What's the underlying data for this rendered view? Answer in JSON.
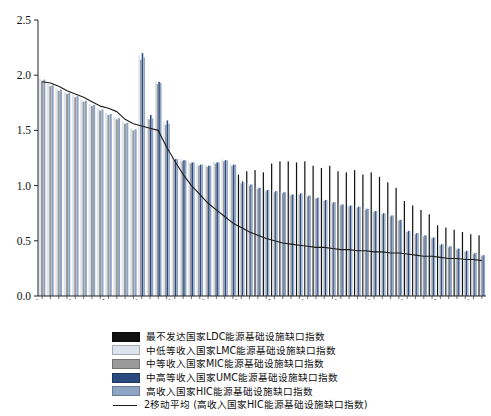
{
  "chart_data": {
    "type": "bar",
    "title": "",
    "xlabel": "",
    "ylabel": "",
    "ylim": [
      0.0,
      2.5
    ],
    "ytick_labels": [
      "0.0",
      "0.5",
      "1.0",
      "1.5",
      "2.0",
      "2.5"
    ],
    "ytick_values": [
      0.0,
      0.5,
      1.0,
      1.5,
      2.0,
      2.5
    ],
    "grid": false,
    "legend_position": "below-plot",
    "xtick_labels": [
      "1960",
      "1964",
      "1968",
      "1972",
      "1976",
      "1980",
      "1984",
      "1988",
      "1992",
      "1996",
      "2000",
      "2004",
      "2008",
      "2012"
    ],
    "categories": [
      1960,
      1961,
      1962,
      1963,
      1964,
      1965,
      1966,
      1967,
      1968,
      1969,
      1970,
      1971,
      1972,
      1973,
      1974,
      1975,
      1976,
      1977,
      1978,
      1979,
      1980,
      1981,
      1982,
      1983,
      1984,
      1985,
      1986,
      1987,
      1988,
      1989,
      1990,
      1991,
      1992,
      1993,
      1994,
      1995,
      1996,
      1997,
      1998,
      1999,
      2000,
      2001,
      2002,
      2003,
      2004,
      2005,
      2006,
      2007,
      2008,
      2009,
      2010,
      2011,
      2012,
      2013
    ],
    "series": [
      {
        "name": "最不发达国家LDC能源基础设施缺口指数",
        "key": "LDC",
        "color": "#111111",
        "values": [
          0,
          0,
          0,
          0,
          0,
          0,
          0,
          0,
          0,
          0,
          0,
          0,
          0,
          0,
          0,
          0,
          0,
          0,
          0,
          0,
          0,
          0,
          0,
          0,
          1.1,
          1.13,
          1.14,
          1.12,
          1.2,
          1.22,
          1.22,
          1.21,
          1.22,
          1.18,
          1.16,
          1.18,
          1.13,
          1.12,
          1.14,
          1.1,
          1.12,
          1.08,
          1.03,
          0.98,
          0.86,
          0.82,
          0.78,
          0.74,
          0.64,
          0.62,
          0.6,
          0.58,
          0.56,
          0.55
        ]
      },
      {
        "name": "中低等收入国家LMC能源基础设施缺口指数",
        "key": "LMC",
        "color": "#dde4ee",
        "values": [
          1.97,
          1.92,
          1.88,
          1.85,
          1.82,
          1.78,
          1.74,
          1.7,
          1.66,
          1.62,
          1.58,
          1.52,
          2.18,
          1.62,
          1.95,
          1.58,
          1.25,
          1.24,
          1.22,
          1.2,
          1.19,
          1.22,
          1.24,
          1.2,
          1.05,
          1.02,
          0.99,
          0.97,
          0.96,
          0.95,
          0.93,
          0.94,
          0.92,
          0.9,
          0.88,
          0.86,
          0.84,
          0.83,
          0.82,
          0.8,
          0.78,
          0.76,
          0.74,
          0.7,
          0.6,
          0.58,
          0.56,
          0.54,
          0.48,
          0.46,
          0.44,
          0.42,
          0.4,
          0.38
        ]
      },
      {
        "name": "中等收入国家MIC能源基础设施缺口指数",
        "key": "MIC",
        "color": "#9a9a9a",
        "values": [
          1.95,
          1.9,
          1.86,
          1.83,
          1.8,
          1.76,
          1.72,
          1.68,
          1.64,
          1.6,
          1.56,
          1.5,
          2.14,
          1.6,
          1.92,
          1.55,
          1.23,
          1.22,
          1.2,
          1.18,
          1.17,
          1.2,
          1.22,
          1.18,
          1.02,
          1.0,
          0.97,
          0.95,
          0.94,
          0.93,
          0.91,
          0.92,
          0.9,
          0.88,
          0.86,
          0.84,
          0.82,
          0.81,
          0.8,
          0.78,
          0.76,
          0.74,
          0.72,
          0.68,
          0.58,
          0.56,
          0.54,
          0.52,
          0.46,
          0.44,
          0.42,
          0.4,
          0.38,
          0.36
        ]
      },
      {
        "name": "中高等收入国家UMC能源基础设施缺口指数",
        "key": "UMC",
        "color": "#2a4a80",
        "values": [
          0,
          0,
          0,
          0,
          0,
          0,
          0,
          0,
          0,
          0,
          0,
          0,
          2.2,
          1.64,
          1.94,
          1.59,
          1.24,
          1.23,
          1.21,
          1.19,
          1.18,
          1.21,
          1.23,
          1.19,
          1.04,
          1.01,
          0.98,
          0.96,
          0.95,
          0.94,
          0.92,
          0.93,
          0.91,
          0.89,
          0.87,
          0.85,
          0.83,
          0.82,
          0.81,
          0.79,
          0.77,
          0.75,
          0.73,
          0.69,
          0.59,
          0.57,
          0.55,
          0.53,
          0.47,
          0.45,
          0.43,
          0.41,
          0.39,
          0.37
        ]
      },
      {
        "name": "高收入国家HIC能源基础设施缺口指数",
        "key": "HIC",
        "color": "#8fa4c4",
        "values": [
          1.96,
          1.91,
          1.87,
          1.84,
          1.81,
          1.77,
          1.73,
          1.69,
          1.65,
          1.61,
          1.57,
          1.51,
          2.16,
          1.61,
          1.93,
          1.56,
          1.24,
          1.23,
          1.21,
          1.19,
          1.18,
          1.21,
          1.23,
          1.19,
          1.03,
          1.01,
          0.98,
          0.96,
          0.95,
          0.94,
          0.92,
          0.93,
          0.91,
          0.89,
          0.87,
          0.85,
          0.83,
          0.82,
          0.81,
          0.79,
          0.77,
          0.75,
          0.73,
          0.69,
          0.59,
          0.57,
          0.55,
          0.53,
          0.47,
          0.45,
          0.43,
          0.41,
          0.39,
          0.37
        ]
      }
    ],
    "trendline": {
      "name": "2移动平均 (高收入国家HIC能源基础设施缺口指数)",
      "color": "#1b1b1b",
      "values": [
        1.94,
        1.93,
        1.9,
        1.86,
        1.83,
        1.8,
        1.76,
        1.72,
        1.7,
        1.67,
        1.6,
        1.56,
        1.54,
        1.52,
        1.5,
        1.35,
        1.22,
        1.1,
        1.0,
        0.92,
        0.84,
        0.78,
        0.72,
        0.66,
        0.62,
        0.58,
        0.55,
        0.52,
        0.5,
        0.48,
        0.47,
        0.46,
        0.45,
        0.44,
        0.44,
        0.43,
        0.42,
        0.42,
        0.41,
        0.41,
        0.4,
        0.4,
        0.39,
        0.39,
        0.38,
        0.37,
        0.36,
        0.36,
        0.35,
        0.34,
        0.34,
        0.33,
        0.33,
        0.32
      ]
    },
    "legend_entries": [
      {
        "label": "最不发达国家LDC能源基础设施缺口指数",
        "color": "#111111",
        "type": "swatch"
      },
      {
        "label": "中低等收入国家LMC能源基础设施缺口指数",
        "color": "#dde4ee",
        "type": "swatch"
      },
      {
        "label": "中等收入国家MIC能源基础设施缺口指数",
        "color": "#9a9a9a",
        "type": "swatch"
      },
      {
        "label": "中高等收入国家UMC能源基础设施缺口指数",
        "color": "#2a4a80",
        "type": "swatch"
      },
      {
        "label": "高收入国家HIC能源基础设施缺口指数",
        "color": "#8fa4c4",
        "type": "swatch"
      },
      {
        "label": "2移动平均 (高收入国家HIC能源基础设施缺口指数)",
        "color": "#1b1b1b",
        "type": "line"
      }
    ]
  }
}
